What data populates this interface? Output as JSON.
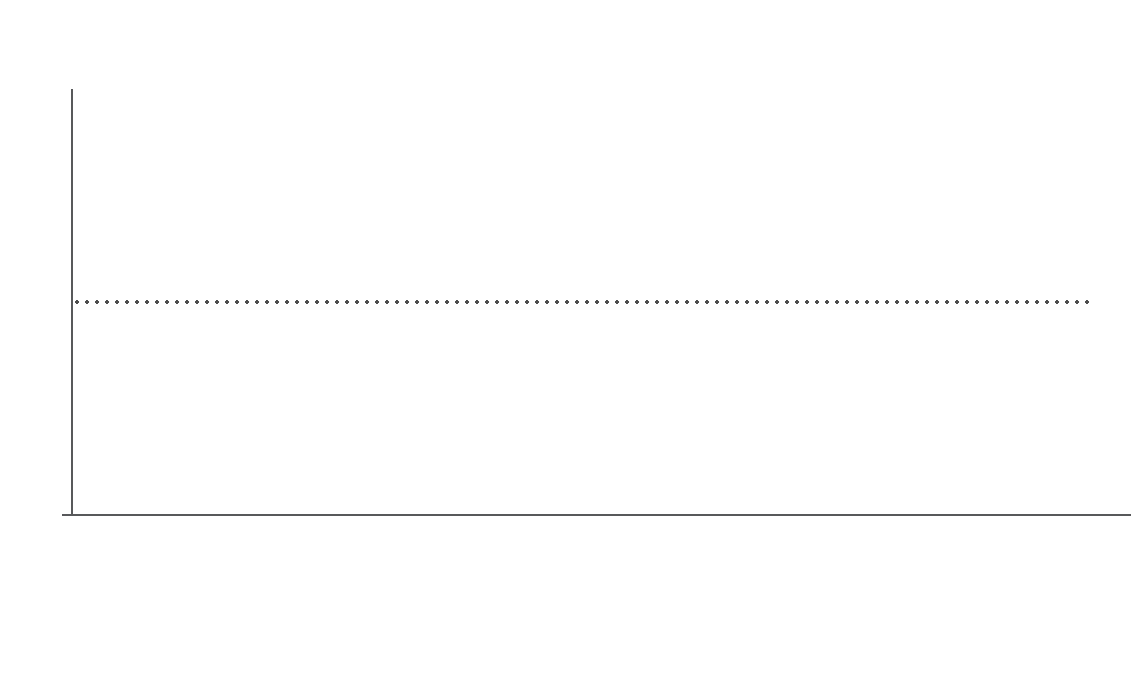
{
  "chart_data": {
    "type": "bar",
    "subtype": "stacked-100-percent",
    "xlabel": "",
    "ylabel": "Percent",
    "ylim": [
      0,
      100
    ],
    "yticks": [
      0,
      10,
      20,
      30,
      40,
      50,
      60,
      70,
      80,
      90,
      100
    ],
    "grid": true,
    "legend_position": "bottom",
    "categories": [
      "South Africa",
      "Burkina Faso",
      "Benin",
      "Togo",
      "Senegal",
      "Niger",
      "Ghana",
      "Mali",
      "Gambia, The",
      "Guinea-Bissau",
      "Liberia",
      "Côte d'Ivoire",
      "Uganda",
      "Nigeria",
      "Tanzania",
      "Malawi",
      "Gabon",
      "Ethiopia"
    ],
    "series": [
      {
        "name": "Inequality of opportunity (inherited circumstances)",
        "color": "#4a79bd",
        "values": [
          74,
          64,
          62,
          60,
          60,
          58,
          57,
          57,
          54,
          54,
          54,
          53,
          50,
          49,
          48,
          45,
          41,
          26
        ]
      },
      {
        "name": "Residual inequality (effort, choice, etc.)",
        "color": "#cc6448",
        "values": [
          26,
          36,
          38,
          40,
          40,
          42,
          43,
          43,
          46,
          46,
          46,
          47,
          50,
          51,
          52,
          55,
          59,
          74
        ]
      }
    ],
    "annotations": [
      {
        "type": "reference-line",
        "orientation": "horizontal",
        "value": 50,
        "style": "dotted",
        "color": "#4d4d4d"
      }
    ]
  }
}
